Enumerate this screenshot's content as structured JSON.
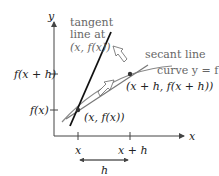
{
  "diagram": {
    "axes": {
      "x_label": "x",
      "y_label": "y",
      "x_ticks": [
        "x",
        "x + h"
      ],
      "y_ticks": [
        "f(x + h)",
        "f(x)"
      ]
    },
    "labels": {
      "tangent_line_1": "tangent",
      "tangent_line_2": "line at",
      "tangent_line_3": "(x, f(x))",
      "secant_line": "secant line",
      "curve": "curve y = f",
      "point_xh": "(x + h, f(x + h))",
      "point_x": "(x, f(x))",
      "interval": "h"
    },
    "colors": {
      "tangent": "#111111",
      "secant": "#777777",
      "curve": "#888888",
      "axis": "#444444",
      "text": "#222222",
      "muted_text": "#666666"
    }
  }
}
